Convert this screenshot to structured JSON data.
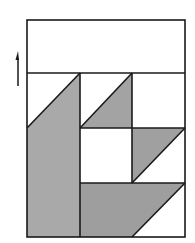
{
  "diagram": {
    "type": "quilt-block",
    "colors": {
      "stroke": "#1a1a1a",
      "fill_light_gray": "#a9a9a9",
      "fill_gray": "#9c9c9c",
      "background": "#ffffff"
    },
    "grain_arrow": {
      "direction": "up",
      "x": 18,
      "y_top": 52,
      "y_bottom": 86
    },
    "frame": {
      "x": 27,
      "y": 20,
      "width": 158,
      "height": 217
    },
    "top_band": {
      "y_top": 20,
      "y_bottom": 73
    },
    "grid": {
      "columns_x": [
        27,
        80,
        132,
        185
      ],
      "rows_y": [
        73,
        128,
        183,
        237
      ]
    },
    "pieces": [
      {
        "name": "left-tall-piece",
        "fill": "gray",
        "points": "27,128 80,73 80,237 27,237"
      },
      {
        "name": "middle-top-triangle",
        "fill": "gray",
        "points": "80,128 132,73 132,128"
      },
      {
        "name": "right-middle-triangle",
        "fill": "gray",
        "points": "132,128 185,128 132,183"
      },
      {
        "name": "bottom-trapezoid",
        "fill": "gray",
        "points": "80,183 185,183 132,237 80,237"
      }
    ]
  }
}
